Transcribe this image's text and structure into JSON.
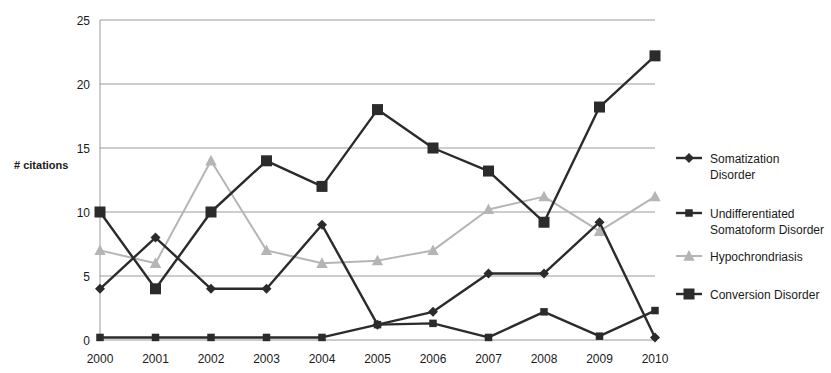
{
  "chart_data": {
    "type": "line",
    "title": "",
    "xlabel": "",
    "ylabel": "# citations",
    "categories": [
      "2000",
      "2001",
      "2002",
      "2003",
      "2004",
      "2005",
      "2006",
      "2007",
      "2008",
      "2009",
      "2010"
    ],
    "ylim": [
      0,
      25
    ],
    "yticks": [
      0,
      5,
      10,
      15,
      20,
      25
    ],
    "grid": true,
    "legend_position": "right",
    "series": [
      {
        "name": "Somatization Disorder",
        "marker": "diamond",
        "color": "#2b2b2b",
        "values": [
          4,
          8,
          4,
          4,
          9,
          1.2,
          2.2,
          5.2,
          5.2,
          9.2,
          0.2
        ]
      },
      {
        "name": "Undifferentiated Somatoform Disorder",
        "marker": "square-small",
        "color": "#2b2b2b",
        "values": [
          0.2,
          0.2,
          0.2,
          0.2,
          0.2,
          1.2,
          1.3,
          0.2,
          2.2,
          0.3,
          2.3
        ]
      },
      {
        "name": "Hypochrondriasis",
        "marker": "triangle",
        "color": "#b5b5b5",
        "values": [
          7,
          6,
          14,
          7,
          6,
          6.2,
          7,
          10.2,
          11.2,
          8.5,
          11.2
        ]
      },
      {
        "name": "Conversion Disorder",
        "marker": "square-large",
        "color": "#2b2b2b",
        "values": [
          10,
          4,
          10,
          14,
          12,
          18,
          15,
          13.2,
          9.2,
          18.2,
          22.2
        ]
      }
    ]
  },
  "legend": {
    "items": [
      {
        "label_line1": "Somatization",
        "label_line2": "Disorder"
      },
      {
        "label_line1": "Undifferentiated",
        "label_line2": "Somatoform Disorder"
      },
      {
        "label_line1": "Hypochrondriasis",
        "label_line2": ""
      },
      {
        "label_line1": "Conversion Disorder",
        "label_line2": ""
      }
    ]
  },
  "axis": {
    "y_title": "# citations"
  }
}
